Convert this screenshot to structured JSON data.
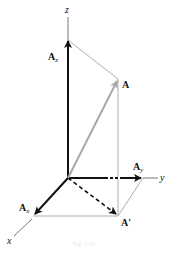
{
  "diagram": {
    "type": "3d-vector-components",
    "labels": {
      "z_axis": "z",
      "y_axis": "y",
      "x_axis": "x",
      "vector_A": "A",
      "vector_Az_main": "A",
      "vector_Az_sub": "z",
      "vector_Ay_main": "A",
      "vector_Ay_sub": "y",
      "vector_Ax_main": "A",
      "vector_Ax_sub": "x",
      "projection": "A'"
    },
    "caption": "Fig. 2-25",
    "colors": {
      "component_arrows": "#111111",
      "resultant_arrow": "#a8a8a8",
      "construction_lines": "#9a9a9a",
      "axes": "#555555"
    }
  }
}
